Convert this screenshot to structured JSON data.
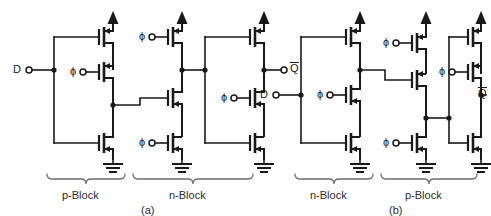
{
  "figure": {
    "type": "schematic",
    "panels": [
      {
        "id": "a",
        "caption": "(a)",
        "blocks": [
          {
            "name": "p-Block",
            "label": "p-Block",
            "side": "left"
          },
          {
            "name": "n-Block",
            "label": "n-Block",
            "side": "right"
          }
        ],
        "io": {
          "input_label": "D",
          "output_label": "Q",
          "output_overbar": true
        },
        "clock_label": "ϕ",
        "supply_label": "VDD",
        "ground_label": "GND",
        "transistor_count": 10,
        "clock_gate_count": 5
      },
      {
        "id": "b",
        "caption": "(b)",
        "blocks": [
          {
            "name": "n-Block",
            "label": "n-Block",
            "side": "left"
          },
          {
            "name": "p-Block",
            "label": "p-Block",
            "side": "right"
          }
        ],
        "io": {
          "input_label": "D",
          "output_label": "Q",
          "output_overbar": true
        },
        "clock_label": "ϕ",
        "supply_label": "VDD",
        "ground_label": "GND",
        "transistor_count": 10,
        "clock_gate_count": 5
      }
    ]
  },
  "colors": {
    "ink": "#1a1a1a",
    "brace": "#6e6e6e",
    "background": "#ffffff",
    "label": "#2b2b2b"
  },
  "labels": {
    "panel_a": {
      "input_d": "D",
      "output_q": "Q",
      "phi_1": "ϕ",
      "phi_2": "ϕ",
      "phi_3": "ϕ",
      "phi_4": "ϕ",
      "phi_5": "ϕ",
      "block_left": "p-Block",
      "block_right": "n-Block",
      "caption": "(a)"
    },
    "panel_b": {
      "input_d": "D",
      "output_q": "Q",
      "phi_1": "ϕ",
      "phi_2": "ϕ",
      "phi_3": "ϕ",
      "phi_4": "ϕ",
      "phi_5": "ϕ",
      "block_left": "n-Block",
      "block_right": "p-Block",
      "caption": "(b)"
    }
  }
}
